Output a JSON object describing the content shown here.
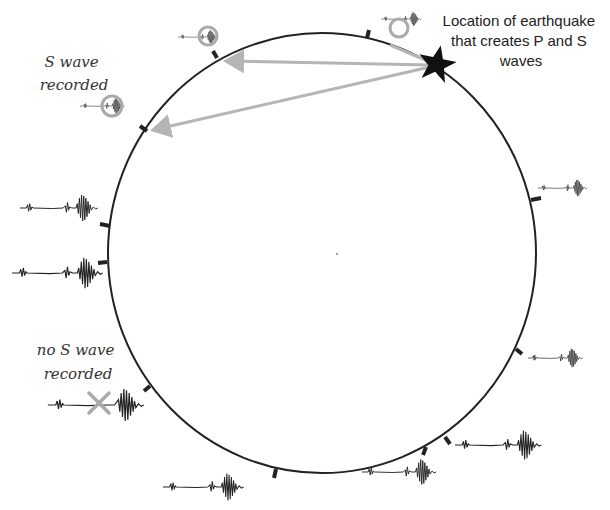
{
  "diagram": {
    "title_label": {
      "lines": [
        "Location of earthquake",
        "that creates P and S",
        "waves"
      ]
    },
    "s_wave_recorded_label": {
      "lines": [
        "S wave",
        "recorded"
      ]
    },
    "no_s_wave_recorded_label": {
      "lines": [
        "no S wave",
        "recorded"
      ]
    },
    "earth_circle": {
      "cx": 322,
      "cy": 253,
      "rx": 214,
      "ry": 220,
      "stroke": "#222222"
    },
    "epicenter_star": {
      "x": 437,
      "y": 63,
      "color": "#111111"
    },
    "arrow_color": "#b5b5b5",
    "highlight_color": "#aaaaaa",
    "stations": [
      {
        "id": "station-top-right",
        "s_wave": true,
        "highlighted": true
      },
      {
        "id": "station-top-left",
        "s_wave": true,
        "highlighted": true
      },
      {
        "id": "station-upper-left",
        "s_wave": true,
        "highlighted": true
      },
      {
        "id": "station-left-1",
        "s_wave": true,
        "highlighted": false
      },
      {
        "id": "station-left-2",
        "s_wave": true,
        "highlighted": false
      },
      {
        "id": "station-lower-left",
        "s_wave": false,
        "highlighted": true
      },
      {
        "id": "station-bottom-left",
        "s_wave": true,
        "highlighted": false
      },
      {
        "id": "station-bottom-right-1",
        "s_wave": true,
        "highlighted": false
      },
      {
        "id": "station-bottom-right-2",
        "s_wave": true,
        "highlighted": false
      },
      {
        "id": "station-right-lower",
        "s_wave": true,
        "highlighted": false
      },
      {
        "id": "station-right-upper",
        "s_wave": true,
        "highlighted": false
      }
    ]
  }
}
